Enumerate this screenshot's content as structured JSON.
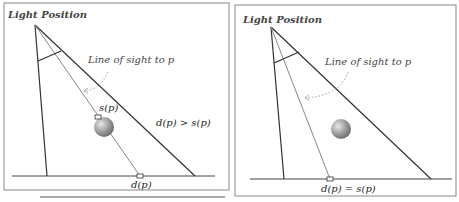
{
  "left_panel": {
    "title": "Light Position",
    "los_label": "Line of sight to p",
    "s_label": "s(p)",
    "d_label": "d(p)",
    "relation": "d(p) > s(p)"
  },
  "right_panel": {
    "title": "Light Position",
    "los_label": "Line of sight to p",
    "relation": "d(p) = s(p)"
  },
  "colors": {
    "line": "#333333",
    "sightline": "#777777",
    "dotted_arc": "#999999",
    "sphere_light": "#e0e0e0",
    "sphere_dark": "#7a7a7a"
  }
}
